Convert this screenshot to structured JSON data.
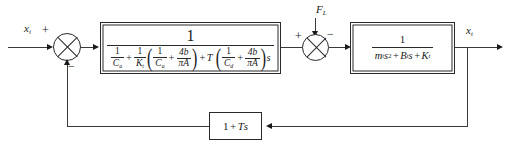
{
  "diagram": {
    "type": "control-system-block-diagram",
    "background": "#ffffff",
    "line_color": "#3a3a3a",
    "signals": {
      "input": {
        "base": "x",
        "sub": "i",
        "label": "x_i"
      },
      "output": {
        "base": "x",
        "sub": "t",
        "label": "x_t"
      },
      "disturbance": {
        "base": "F",
        "sub": "L",
        "label": "F_L"
      }
    },
    "summers": {
      "first": {
        "name": "input-summing-junction",
        "input_sign": "+",
        "feedback_sign": "−"
      },
      "second": {
        "name": "disturbance-summing-junction",
        "forward_sign": "+",
        "disturbance_sign": "−"
      }
    },
    "blocks": {
      "compensator": {
        "name": "compensator-block",
        "numerator": "1",
        "denominator_terms": {
          "t1": {
            "num": "1",
            "den_base": "C",
            "den_sub": "a"
          },
          "t2": {
            "num": "1",
            "den_base": "K",
            "den_sub": "t"
          },
          "t3": {
            "num": "1",
            "den_base": "C",
            "den_sub": "a"
          },
          "t4": {
            "num": "4b",
            "den": "πA"
          },
          "t5": {
            "symbol": "T"
          },
          "t6": {
            "num": "1",
            "den_base": "C",
            "den_sub": "d"
          },
          "t7": {
            "num": "4b",
            "den": "πA"
          },
          "t8": {
            "symbol": "s"
          }
        }
      },
      "plant": {
        "name": "plant-block",
        "numerator": "1",
        "denominator": {
          "mass": "m",
          "mass_sub": "t",
          "s_squared": "s",
          "damping": "B",
          "damping_sub": "t",
          "stiffness": "K",
          "stiffness_sub": "t"
        }
      },
      "feedback": {
        "name": "feedback-block",
        "expression": "1 + Ts",
        "constant": "1",
        "gain": "T",
        "laplace": "s"
      }
    }
  }
}
